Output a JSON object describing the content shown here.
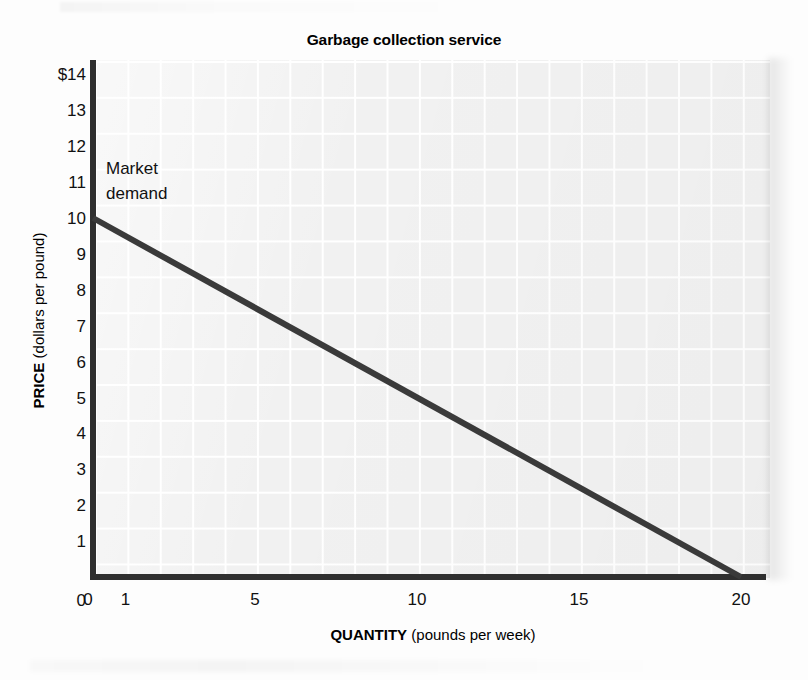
{
  "chart_data": {
    "type": "line",
    "title": "Garbage collection service",
    "xlabel_bold": "QUANTITY",
    "xlabel_rest": " (pounds per week)",
    "ylabel_bold": "PRICE",
    "ylabel_rest": " (dollars per pound)",
    "xlim": [
      0,
      20.8
    ],
    "ylim": [
      0,
      14
    ],
    "grid": true,
    "legend_position": "none",
    "x_tick_labels": [
      "0",
      "1",
      "5",
      "10",
      "15",
      "20"
    ],
    "x_tick_values": [
      0,
      1,
      5,
      10,
      15,
      20
    ],
    "y_tick_labels": [
      "$14",
      "13",
      "12",
      "11",
      "10",
      "9",
      "8",
      "7",
      "6",
      "5",
      "4",
      "3",
      "2",
      "1",
      "0"
    ],
    "y_tick_values": [
      14,
      13,
      12,
      11,
      10,
      9,
      8,
      7,
      6,
      5,
      4,
      3,
      2,
      1,
      0
    ],
    "series": [
      {
        "name": "Market demand",
        "color": "#3a3a3a",
        "linewidth": 6,
        "x": [
          0,
          20
        ],
        "y": [
          10,
          0
        ],
        "points": [
          {
            "x": 0,
            "y": 10
          },
          {
            "x": 2,
            "y": 9
          },
          {
            "x": 4,
            "y": 8
          },
          {
            "x": 6,
            "y": 7
          },
          {
            "x": 8,
            "y": 6
          },
          {
            "x": 10,
            "y": 5
          },
          {
            "x": 12,
            "y": 4
          },
          {
            "x": 14,
            "y": 3
          },
          {
            "x": 16,
            "y": 2
          },
          {
            "x": 18,
            "y": 1
          },
          {
            "x": 20,
            "y": 0
          }
        ]
      }
    ],
    "annotations": [
      {
        "name": "market-demand-label",
        "text": "Market\ndemand",
        "x": 0.4,
        "y": 11.6
      }
    ]
  },
  "colors": {
    "line": "#3a3a3a",
    "axis": "#2f2f2f",
    "plot_background": "#f1f1f1",
    "grid_line": "#ffffff",
    "page_background": "#fdfdfd",
    "text": "#111111"
  }
}
